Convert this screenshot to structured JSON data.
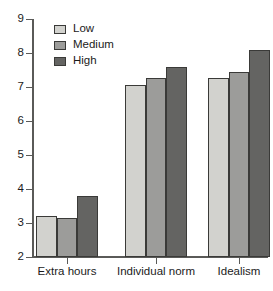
{
  "chart_data": {
    "type": "bar",
    "title": "",
    "xlabel": "",
    "ylabel": "",
    "categories": [
      "Extra hours",
      "Individual norm",
      "Idealism"
    ],
    "series": [
      {
        "name": "Low",
        "color": "#d2d2ce",
        "values": [
          3.2,
          7.05,
          7.26
        ]
      },
      {
        "name": "Medium",
        "color": "#9c9c9a",
        "values": [
          3.15,
          7.27,
          7.45
        ]
      },
      {
        "name": "High",
        "color": "#646462",
        "values": [
          3.78,
          7.6,
          8.08
        ]
      }
    ],
    "ylim": [
      2,
      9
    ],
    "yticks": [
      2,
      3,
      4,
      5,
      6,
      7,
      8,
      9
    ],
    "ytick_labels": [
      "2",
      "3",
      "4",
      "5",
      "6",
      "7",
      "8",
      "9"
    ],
    "grid": false,
    "legend_position": "top-left",
    "legend_entries": [
      "Low",
      "Medium",
      "High"
    ],
    "axis_color": "#5a5a58",
    "bar_edge_color": "#3a3a38",
    "background": "#ffffff"
  }
}
